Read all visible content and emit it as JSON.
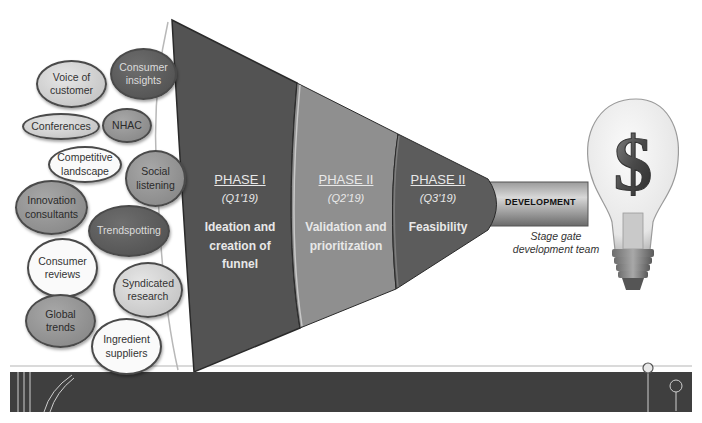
{
  "diagram": {
    "type": "innovation-funnel",
    "inputs": [
      {
        "label": "Voice of customer",
        "line1": "Voice of",
        "line2": "customer",
        "shade": "light"
      },
      {
        "label": "Consumer insights",
        "line1": "Consumer",
        "line2": "insights",
        "shade": "dark"
      },
      {
        "label": "Conferences",
        "line1": "Conferences",
        "line2": "",
        "shade": "light"
      },
      {
        "label": "NHAC",
        "line1": "NHAC",
        "line2": "",
        "shade": "mid"
      },
      {
        "label": "Competitive landscape",
        "line1": "Competitive",
        "line2": "landscape",
        "shade": "white"
      },
      {
        "label": "Social listening",
        "line1": "Social",
        "line2": "listening",
        "shade": "mid"
      },
      {
        "label": "Innovation consultants",
        "line1": "Innovation",
        "line2": "consultants",
        "shade": "mid"
      },
      {
        "label": "Trendspotting",
        "line1": "Trendspotting",
        "line2": "",
        "shade": "dark"
      },
      {
        "label": "Consumer reviews",
        "line1": "Consumer",
        "line2": "reviews",
        "shade": "white"
      },
      {
        "label": "Syndicated research",
        "line1": "Syndicated",
        "line2": "research",
        "shade": "light"
      },
      {
        "label": "Global trends",
        "line1": "Global",
        "line2": "trends",
        "shade": "mid"
      },
      {
        "label": "Ingredient suppliers",
        "line1": "Ingredient",
        "line2": "suppliers",
        "shade": "white"
      }
    ],
    "phases": [
      {
        "title": "PHASE I",
        "period": "(Q1'19)",
        "desc1": "Ideation and",
        "desc2": "creation of",
        "desc3": "funnel"
      },
      {
        "title": "PHASE II",
        "period": "(Q2'19)",
        "desc1": "Validation and",
        "desc2": "prioritization",
        "desc3": ""
      },
      {
        "title": "PHASE II",
        "period": "(Q3'19)",
        "desc1": "Feasibility",
        "desc2": "",
        "desc3": ""
      }
    ],
    "output": {
      "tube_label": "DEVELOPMENT",
      "caption_line1": "Stage gate",
      "caption_line2": "development team",
      "result_icon": "dollar-lightbulb",
      "result_symbol": "$"
    },
    "colors": {
      "phase1": "#555555",
      "phase2": "#8e8e8e",
      "phase3": "#5e5e5e",
      "base_bar": "#3d3d3d"
    }
  }
}
